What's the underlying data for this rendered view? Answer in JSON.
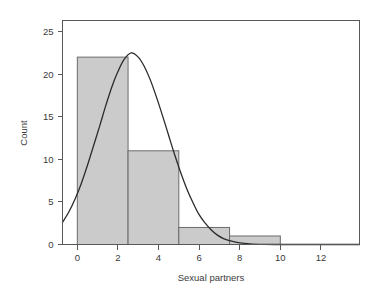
{
  "chart_data": {
    "type": "bar",
    "title": "",
    "subtitle": "",
    "xlabel": "Sexual partners",
    "ylabel": "Count",
    "xlim": [
      -0.73,
      13.9
    ],
    "ylim": [
      0,
      26.3
    ],
    "grid": false,
    "legend": null,
    "bin_width": 2.5,
    "categories": [
      "0-2.5",
      "2.5-5",
      "5-7.5",
      "7.5-10"
    ],
    "bin_edges": [
      0,
      2.5,
      5,
      7.5,
      10
    ],
    "values": [
      22,
      11,
      2,
      1
    ],
    "bars": [
      {
        "x0": 0,
        "x1": 2.5,
        "count": 22
      },
      {
        "x0": 2.5,
        "x1": 5,
        "count": 11
      },
      {
        "x0": 5,
        "x1": 7.5,
        "count": 2
      },
      {
        "x0": 7.5,
        "x1": 10,
        "count": 1
      }
    ],
    "xticks": [
      0,
      2,
      4,
      6,
      8,
      10,
      12
    ],
    "xticklabels": [
      "0",
      "2",
      "4",
      "6",
      "8",
      "10",
      "12"
    ],
    "yticks": [
      0,
      5,
      10,
      15,
      20,
      25
    ],
    "yticklabels": [
      "0",
      "5",
      "10",
      "15",
      "20",
      "25"
    ],
    "overlay_curve": {
      "name": "normal-density",
      "peak_x": 2.65,
      "peak_y": 22.5,
      "mean": 2.65,
      "sigma": 1.62,
      "amplitude": 22.5,
      "points": [
        [
          -0.73,
          2.6
        ],
        [
          -0.4,
          3.9
        ],
        [
          -0.1,
          5.4
        ],
        [
          0.2,
          7.2
        ],
        [
          0.5,
          9.3
        ],
        [
          0.8,
          11.6
        ],
        [
          1.1,
          13.9
        ],
        [
          1.4,
          16.3
        ],
        [
          1.7,
          18.5
        ],
        [
          2.0,
          20.3
        ],
        [
          2.3,
          21.7
        ],
        [
          2.65,
          22.5
        ],
        [
          3.0,
          22.0
        ],
        [
          3.3,
          20.9
        ],
        [
          3.6,
          19.3
        ],
        [
          3.9,
          17.3
        ],
        [
          4.2,
          15.1
        ],
        [
          4.5,
          12.8
        ],
        [
          4.8,
          10.5
        ],
        [
          5.1,
          8.4
        ],
        [
          5.4,
          6.5
        ],
        [
          5.7,
          4.9
        ],
        [
          6.0,
          3.5
        ],
        [
          6.3,
          2.5
        ],
        [
          6.6,
          1.7
        ],
        [
          6.9,
          1.1
        ],
        [
          7.2,
          0.7
        ],
        [
          7.6,
          0.4
        ],
        [
          8.0,
          0.2
        ],
        [
          8.5,
          0.08
        ],
        [
          9.2,
          0.02
        ],
        [
          10.0,
          0.0
        ],
        [
          11.0,
          0.0
        ],
        [
          12.0,
          0.0
        ],
        [
          13.9,
          0.0
        ]
      ]
    },
    "colors": {
      "bar_fill": "#cbcbcb",
      "bar_stroke": "#6b6b6b",
      "curve": "#2b2b2b",
      "axis": "#585858",
      "text": "#3a3a3a",
      "background": "#ffffff"
    }
  }
}
